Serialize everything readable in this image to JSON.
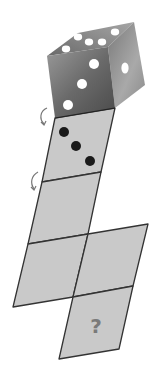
{
  "figure": {
    "question_label": "?",
    "colors": {
      "background": "#ffffff",
      "square_fill": "#c9c9c9",
      "square_stroke": "#333333",
      "pip_dark": "#1a1a1a",
      "pip_light": "#ffffff",
      "cube_top": "#8c8c8c",
      "cube_front": "#6e6e6e",
      "cube_right": "#9a9a9a",
      "arrow": "#777777",
      "question_mark": "#7a7a7a"
    },
    "die": {
      "top_face_pips": 5,
      "front_face_pips": 3,
      "right_face_pips": 1
    },
    "net": {
      "squares": [
        {
          "id": "sq1",
          "pips": 3,
          "label": ""
        },
        {
          "id": "sq2",
          "pips": 0,
          "label": ""
        },
        {
          "id": "sq3-left",
          "pips": 0,
          "label": ""
        },
        {
          "id": "sq3-right",
          "pips": 0,
          "label": ""
        },
        {
          "id": "sq4",
          "pips": 0,
          "label": "?"
        }
      ]
    },
    "rotation_arrows": 2
  }
}
